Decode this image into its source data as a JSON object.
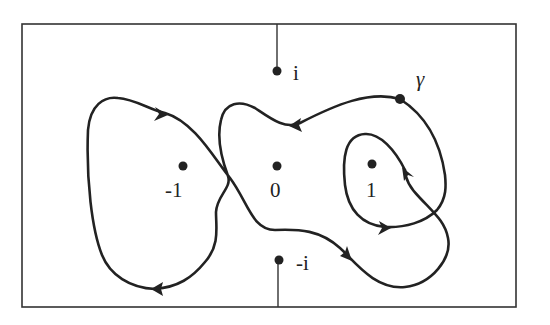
{
  "figure": {
    "type": "contour-diagram",
    "frame": {
      "x": 22,
      "y": 24,
      "width": 494,
      "height": 283
    },
    "branch_cuts": [
      {
        "from": [
          277,
          24
        ],
        "to": [
          277,
          71
        ],
        "description": "cut from top edge to i"
      },
      {
        "from": [
          277,
          262
        ],
        "to": [
          277,
          307
        ],
        "description": "cut from -i to bottom edge"
      }
    ],
    "points": [
      {
        "name": "i",
        "label": "i",
        "x": 277,
        "y": 71,
        "label_x": 293,
        "label_y": 79
      },
      {
        "name": "-1",
        "label": "-1",
        "x": 183,
        "y": 166,
        "label_x": 166,
        "label_y": 196
      },
      {
        "name": "0",
        "label": "0",
        "x": 277,
        "y": 166,
        "label_x": 270,
        "label_y": 196
      },
      {
        "name": "1",
        "label": "1",
        "x": 372,
        "y": 166,
        "label_x": 366,
        "label_y": 196
      },
      {
        "name": "-i",
        "label": "-i",
        "x": 279,
        "y": 260,
        "label_x": 296,
        "label_y": 269
      }
    ],
    "curve": {
      "name": "gamma",
      "label": "γ",
      "label_x": 418,
      "label_y": 86,
      "start_point": {
        "x": 400,
        "y": 99
      },
      "stroke": "#222222"
    },
    "colors": {
      "ink": "#222222",
      "background": "#ffffff",
      "frame": "#333333"
    }
  }
}
